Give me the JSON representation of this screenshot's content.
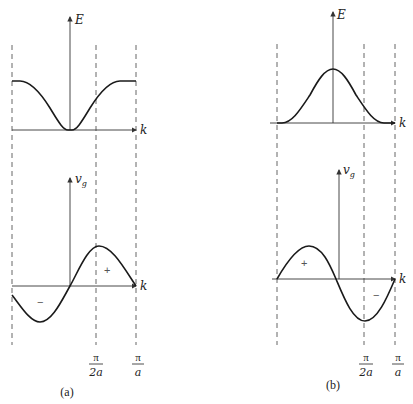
{
  "panels": [
    {
      "id": "a",
      "caption": "(a)",
      "top_plot": {
        "y_label": "E",
        "x_label": "k",
        "shape": "inverted bell (minimum at k=0, flat at zone edges)"
      },
      "bottom_plot": {
        "y_label": "v",
        "y_label_sub": "g",
        "x_label": "k",
        "region_labels": [
          "+",
          "−"
        ]
      },
      "tick_labels": [
        {
          "num": "π",
          "den": "2a"
        },
        {
          "num": "π",
          "den": "a"
        }
      ]
    },
    {
      "id": "b",
      "caption": "(b)",
      "top_plot": {
        "y_label": "E",
        "x_label": "k",
        "shape": "bell (maximum at k=0)"
      },
      "bottom_plot": {
        "y_label": "v",
        "y_label_sub": "g",
        "x_label": "k",
        "region_labels": [
          "+",
          "−"
        ]
      },
      "tick_labels": [
        {
          "num": "π",
          "den": "2a"
        },
        {
          "num": "π",
          "den": "a"
        }
      ]
    }
  ],
  "colors": {
    "curve": "#1a1a1a",
    "axis": "#333333",
    "dashed": "#555555"
  }
}
